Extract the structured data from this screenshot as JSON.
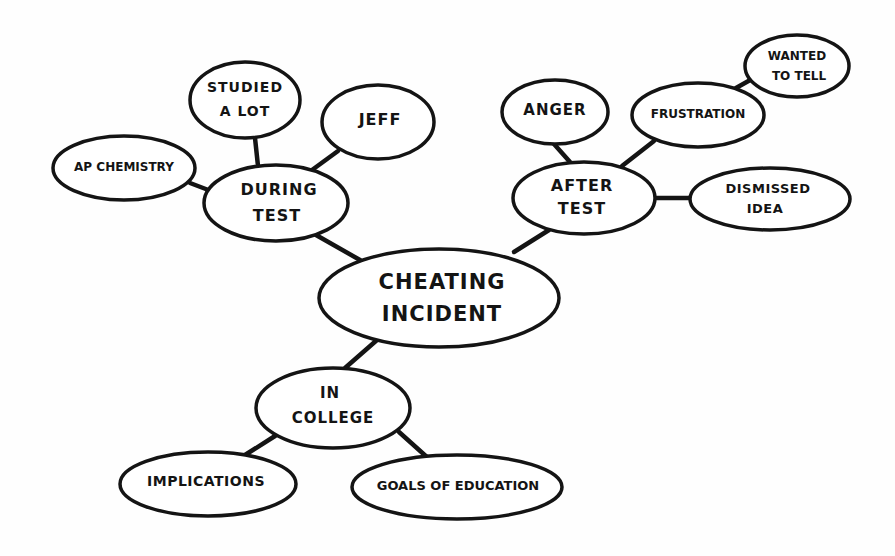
{
  "diagram": {
    "type": "mind-map",
    "style": "hand-drawn bubble map",
    "colors": {
      "background": "#fefefe",
      "stroke": "#141414",
      "node_fill": "#ffffff",
      "ghost_text": "#f1f1f1"
    },
    "central_node": {
      "id": "cheating-incident",
      "lines": [
        "CHEATING",
        "INCIDENT"
      ]
    },
    "nodes": [
      {
        "id": "during-test",
        "lines": [
          "DURING",
          "TEST"
        ],
        "parent": "cheating-incident"
      },
      {
        "id": "ap-chemistry",
        "lines": [
          "AP CHEMISTRY"
        ],
        "parent": "during-test"
      },
      {
        "id": "studied-a-lot",
        "lines": [
          "STUDIED",
          "A LOT"
        ],
        "parent": "during-test"
      },
      {
        "id": "jeff",
        "lines": [
          "JEFF"
        ],
        "parent": "during-test"
      },
      {
        "id": "after-test",
        "lines": [
          "AFTER",
          "TEST"
        ],
        "parent": "cheating-incident"
      },
      {
        "id": "anger",
        "lines": [
          "ANGER"
        ],
        "parent": "after-test"
      },
      {
        "id": "frustration",
        "lines": [
          "FRUSTRATION"
        ],
        "parent": "after-test"
      },
      {
        "id": "wanted-to-tell",
        "lines": [
          "WANTED",
          "TO TELL"
        ],
        "parent": "frustration"
      },
      {
        "id": "dismissed-idea",
        "lines": [
          "DISMISSED",
          "IDEA"
        ],
        "parent": "after-test"
      },
      {
        "id": "in-college",
        "lines": [
          "IN",
          "COLLEGE"
        ],
        "parent": "cheating-incident"
      },
      {
        "id": "implications",
        "lines": [
          "IMPLICATIONS"
        ],
        "parent": "in-college"
      },
      {
        "id": "goals-of-education",
        "lines": [
          "GOALS OF EDUCATION"
        ],
        "parent": "in-college"
      }
    ],
    "edges": [
      [
        "cheating-incident",
        "during-test"
      ],
      [
        "cheating-incident",
        "after-test"
      ],
      [
        "cheating-incident",
        "in-college"
      ],
      [
        "during-test",
        "ap-chemistry"
      ],
      [
        "during-test",
        "studied-a-lot"
      ],
      [
        "during-test",
        "jeff"
      ],
      [
        "after-test",
        "anger"
      ],
      [
        "after-test",
        "frustration"
      ],
      [
        "after-test",
        "dismissed-idea"
      ],
      [
        "frustration",
        "wanted-to-tell"
      ],
      [
        "in-college",
        "implications"
      ],
      [
        "in-college",
        "goals-of-education"
      ]
    ]
  },
  "labels": {
    "cheating_incident_1": "CHEATING",
    "cheating_incident_2": "INCIDENT",
    "during_test_1": "DURING",
    "during_test_2": "TEST",
    "ap_chemistry": "AP CHEMISTRY",
    "studied_a_lot_1": "STUDIED",
    "studied_a_lot_2": "A LOT",
    "jeff": "JEFF",
    "after_test_1": "AFTER",
    "after_test_2": "TEST",
    "anger": "ANGER",
    "frustration": "FRUSTRATION",
    "wanted_to_tell_1": "WANTED",
    "wanted_to_tell_2": "TO TELL",
    "dismissed_idea_1": "DISMISSED",
    "dismissed_idea_2": "IDEA",
    "in_college_1": "IN",
    "in_college_2": "COLLEGE",
    "implications": "IMPLICATIONS",
    "goals_of_education": "GOALS OF EDUCATION"
  }
}
